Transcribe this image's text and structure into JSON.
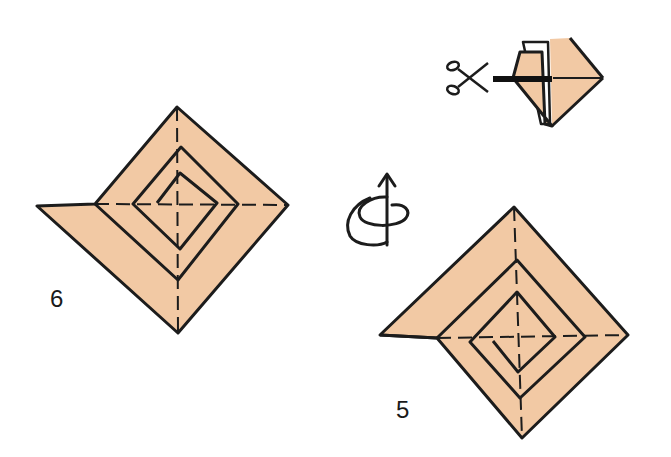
{
  "diagram": {
    "type": "origami-instructions",
    "colors": {
      "paper": "#f2c9a4",
      "line": "#1c1c1c",
      "background": "#ffffff"
    },
    "steps": [
      {
        "id": "step-6",
        "number": "6",
        "description": "Spiral-folded square with flap extending left"
      },
      {
        "id": "step-5",
        "number": "5",
        "description": "Spiral-folded square with flap extending left, inner folds"
      }
    ],
    "symbols": [
      {
        "name": "turn-over-icon",
        "meaning": "Turn the model over"
      },
      {
        "name": "scissors-icon",
        "meaning": "Cut along the thick line"
      }
    ]
  }
}
